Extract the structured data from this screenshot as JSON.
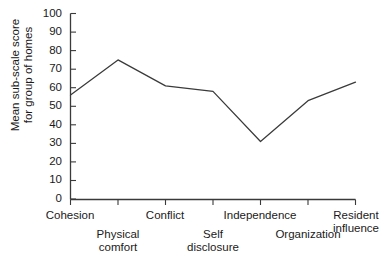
{
  "chart_data": {
    "type": "line",
    "title": "",
    "xlabel": "",
    "ylabel": "Mean sub-scale score for group of homes",
    "ylabel_lines": [
      "Mean sub-scale score",
      "for group of homes"
    ],
    "categories": [
      "Cohesion",
      "Physical comfort",
      "Conflict",
      "Self disclosure",
      "Independence",
      "Organization",
      "Resident influence"
    ],
    "category_lines": [
      [
        "Cohesion"
      ],
      [
        "Physical",
        "comfort"
      ],
      [
        "Conflict"
      ],
      [
        "Self",
        "disclosure"
      ],
      [
        "Independence"
      ],
      [
        "Organization"
      ],
      [
        "Resident",
        "influence"
      ]
    ],
    "values": [
      56,
      75,
      61,
      58,
      31,
      53,
      63
    ],
    "ylim": [
      0,
      100
    ],
    "ytick_values": [
      0,
      10,
      20,
      30,
      40,
      50,
      60,
      70,
      80,
      90,
      100
    ],
    "ytick_labels": [
      "0",
      "10",
      "20",
      "30",
      "40",
      "50",
      "60",
      "70",
      "80",
      "90",
      "100"
    ],
    "grid": false,
    "legend": false,
    "line_color": "#3a3a3a",
    "axis_color": "#3a3a3a",
    "markers": false
  }
}
